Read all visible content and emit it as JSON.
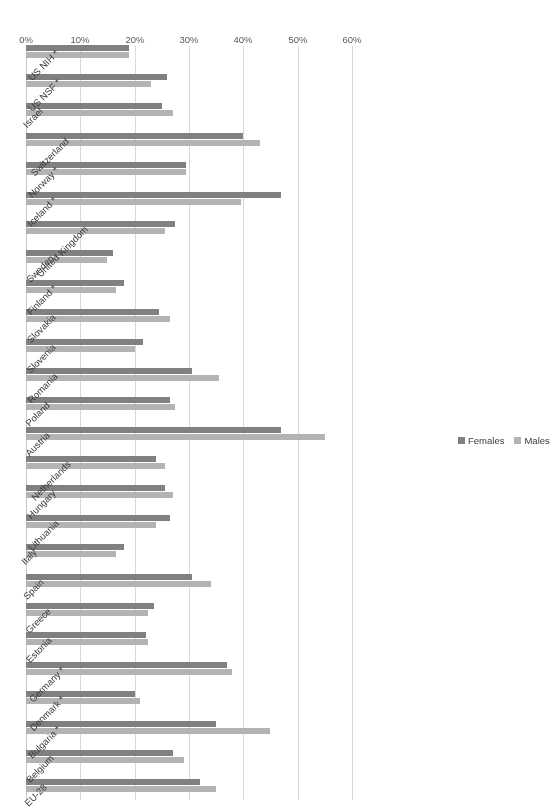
{
  "chart_data": {
    "type": "bar",
    "orientation": "horizontal",
    "title": "",
    "subtitle": "",
    "xlabel": "",
    "ylabel": "",
    "xlim": [
      0,
      60
    ],
    "xticks": [
      "0%",
      "10%",
      "20%",
      "30%",
      "40%",
      "50%",
      "60%"
    ],
    "xtick_values": [
      0,
      10,
      20,
      30,
      40,
      50,
      60
    ],
    "grid": true,
    "legend_position": "bottom-right",
    "legend": [
      {
        "name": "Females",
        "color": "#808080"
      },
      {
        "name": "Males",
        "color": "#b3b3b3"
      }
    ],
    "categories": [
      "EU-28",
      "Belgium",
      "Bulgaria *",
      "Denmark *",
      "Germany *",
      "Estonia",
      "Greece",
      "Spain",
      "Italy",
      "Lithuania",
      "Hungary",
      "Netherlands",
      "Austria",
      "Poland",
      "Romania",
      "Slovenia",
      "Slovakia",
      "Finland *",
      "Sweden",
      "United Kingdom",
      "Iceland *",
      "Norway *",
      "Switzerland",
      "Israel",
      "US NSF *",
      "US NIH *"
    ],
    "series": [
      {
        "name": "Females",
        "color": "#808080",
        "values": [
          32.0,
          27.0,
          35.0,
          20.0,
          37.0,
          22.0,
          23.5,
          30.5,
          18.0,
          26.5,
          25.5,
          24.0,
          47.0,
          26.5,
          30.5,
          21.5,
          24.5,
          18.0,
          16.0,
          27.5,
          47.0,
          29.5,
          40.0,
          25.0,
          26.0,
          19.0
        ]
      },
      {
        "name": "Males",
        "color": "#b3b3b3",
        "values": [
          35.0,
          29.0,
          45.0,
          21.0,
          38.0,
          22.5,
          22.5,
          34.0,
          16.5,
          24.0,
          27.0,
          25.5,
          55.0,
          27.5,
          35.5,
          20.0,
          26.5,
          16.5,
          15.0,
          25.5,
          39.5,
          29.5,
          43.0,
          27.0,
          23.0,
          19.0
        ]
      }
    ]
  }
}
